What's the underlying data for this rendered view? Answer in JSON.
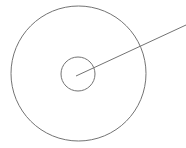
{
  "figure": {
    "name": "concentric-circles-with-radial-line",
    "width": 186,
    "height": 148,
    "background_color": "#ffffff",
    "stroke_color": "#737373",
    "stroke_width": 1
  },
  "chart_data": {
    "type": "diagram",
    "title": "",
    "xlabel": "",
    "ylabel": "",
    "shapes": [
      {
        "id": "outer-circle",
        "type": "circle",
        "cx": 78.5,
        "cy": 73.5,
        "r": 67.5,
        "stroke": "#737373",
        "stroke_width": 1,
        "fill": "none"
      },
      {
        "id": "inner-circle",
        "type": "circle",
        "cx": 78,
        "cy": 74,
        "r": 17,
        "stroke": "#737373",
        "stroke_width": 1,
        "fill": "none"
      },
      {
        "id": "radial-line",
        "type": "line",
        "x1": 76,
        "y1": 76,
        "x2": 186,
        "y2": 25,
        "stroke": "#737373",
        "stroke_width": 1
      }
    ],
    "annotations": []
  }
}
